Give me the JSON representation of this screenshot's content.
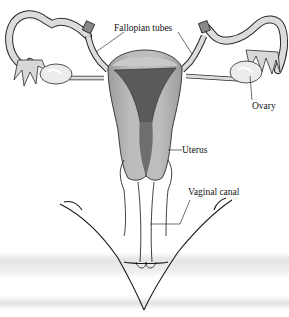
{
  "diagram": {
    "labels": {
      "fallopian_tubes": "Fallopian tubes",
      "ovary": "Ovary",
      "uterus": "Uterus",
      "vaginal_canal": "Vaginal canal"
    },
    "colors": {
      "tissue_light": "#d6d6d6",
      "tissue_mid": "#b4b4b4",
      "uterine_cavity": "#5a5a5a",
      "ovary": "#ececec",
      "outline": "#2a2a2a",
      "scan_band": "#e6e6e6"
    }
  }
}
